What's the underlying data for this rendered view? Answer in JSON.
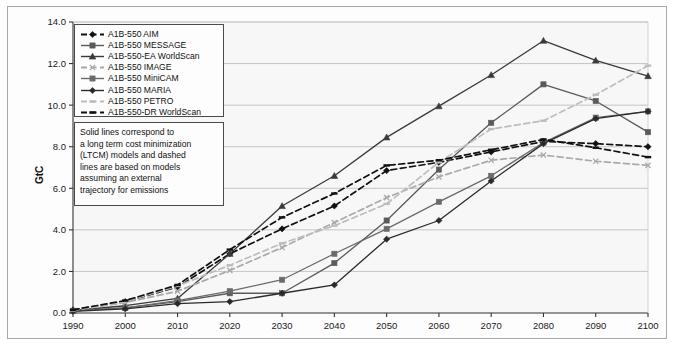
{
  "chart_data": {
    "type": "line",
    "title": "",
    "xlabel": "",
    "ylabel": "GtC",
    "xlim": [
      1990,
      2100
    ],
    "ylim": [
      0.0,
      14.0
    ],
    "yticks": [
      "0.0",
      "2.0",
      "4.0",
      "6.0",
      "8.0",
      "10.0",
      "12.0",
      "14.0"
    ],
    "ytick_values": [
      0,
      2,
      4,
      6,
      8,
      10,
      12,
      14
    ],
    "grid": "horizontal",
    "legend_position": "top-left inside",
    "x": [
      1990,
      2000,
      2010,
      2020,
      2030,
      2040,
      2050,
      2060,
      2070,
      2080,
      2090,
      2100
    ],
    "xticks": [
      "1990",
      "2000",
      "2010",
      "2020",
      "2030",
      "2040",
      "2050",
      "2060",
      "2070",
      "2080",
      "2090",
      "2100"
    ],
    "annotation": "Solid lines correspond to\na long term cost minimization\n(LTCM) models and dashed\nlines are based on models\nassuming an external\ntrajectory for emissions",
    "series": [
      {
        "name": "A1B-550 AIM",
        "style": "dashed",
        "marker": "diamond",
        "color": "#111111",
        "values": [
          0.15,
          0.55,
          1.25,
          2.85,
          4.05,
          5.15,
          6.85,
          7.25,
          7.75,
          8.25,
          8.15,
          8.0
        ]
      },
      {
        "name": "A1B-550 MESSAGE",
        "style": "solid",
        "marker": "square",
        "color": "#5a5a5a",
        "values": [
          0.1,
          0.25,
          0.55,
          0.95,
          0.95,
          2.4,
          4.45,
          6.9,
          9.15,
          11.0,
          10.2,
          8.7
        ]
      },
      {
        "name": "A1B-550-EA WorldScan",
        "style": "solid",
        "marker": "triangle",
        "color": "#3a3a3a",
        "values": [
          0.12,
          0.35,
          0.7,
          2.85,
          5.15,
          6.6,
          8.45,
          9.95,
          11.45,
          13.1,
          12.15,
          11.4
        ]
      },
      {
        "name": "A1B-550 IMAGE",
        "style": "dashed",
        "marker": "x",
        "color": "#aaaaaa",
        "values": [
          0.12,
          0.5,
          1.05,
          2.05,
          3.15,
          4.35,
          5.55,
          6.55,
          7.35,
          7.6,
          7.3,
          7.1
        ]
      },
      {
        "name": "A1B-550 MiniCAM",
        "style": "solid",
        "marker": "square",
        "color": "#6a6a6a",
        "values": [
          0.1,
          0.25,
          0.6,
          1.05,
          1.6,
          2.85,
          4.05,
          5.35,
          6.6,
          8.2,
          9.4,
          9.7
        ]
      },
      {
        "name": "A1B-550 MARIA",
        "style": "solid",
        "marker": "diamond",
        "color": "#2a2a2a",
        "values": [
          0.08,
          0.2,
          0.45,
          0.55,
          0.95,
          1.35,
          3.55,
          4.45,
          6.35,
          8.15,
          9.35,
          9.7
        ]
      },
      {
        "name": "A1B-550 PETRO",
        "style": "dashed",
        "marker": "dash",
        "color": "#bdbdbd",
        "values": [
          0.12,
          0.55,
          1.3,
          2.3,
          3.35,
          4.2,
          5.25,
          7.25,
          8.85,
          9.25,
          10.5,
          11.9
        ]
      },
      {
        "name": "A1B-550-DR WorldScan",
        "style": "dashed",
        "marker": "dash",
        "color": "#111111",
        "values": [
          0.15,
          0.6,
          1.35,
          3.05,
          4.6,
          5.75,
          7.1,
          7.35,
          7.85,
          8.35,
          7.95,
          7.5
        ]
      }
    ]
  }
}
